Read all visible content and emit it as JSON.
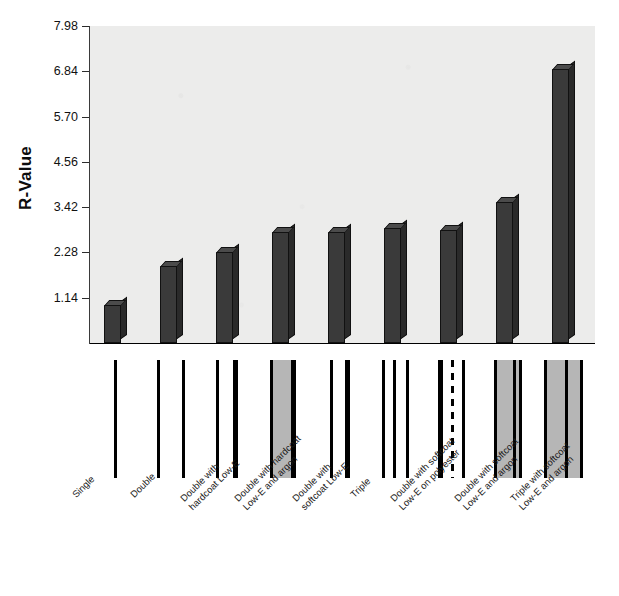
{
  "chart_data": {
    "type": "bar",
    "title": "",
    "xlabel": "",
    "ylabel": "R-Value",
    "ylim": [
      0,
      7.98
    ],
    "grid": false,
    "legend": "none",
    "ytick_labels": [
      "7.98",
      "6.84",
      "5.70",
      "4.56",
      "3.42",
      "2.28",
      "1.14"
    ],
    "ytick_values": [
      7.98,
      6.84,
      5.7,
      4.56,
      3.42,
      2.28,
      1.14
    ],
    "categories": [
      "Single",
      "Double",
      "Double with\nhardcoat Low-E",
      "Double with hardcoat\nLow-E and argon",
      "Double with\nsoftcoat Low-E",
      "Triple",
      "Double with softcoat\nLow-E on polyester",
      "Double with softcoat\nLow-E and argon",
      "Triple with softcoat\nLow-E and argon"
    ],
    "values": [
      0.95,
      1.95,
      2.3,
      2.8,
      2.8,
      2.9,
      2.85,
      3.55,
      6.9
    ],
    "bar_color": "#3a3a3a",
    "plot_background": "#ececeb",
    "page_background": "#ffffff"
  },
  "glazing_diagrams": [
    {
      "name": "single",
      "panes": 1,
      "fills": []
    },
    {
      "name": "double",
      "panes": 2,
      "fills": [
        "air"
      ]
    },
    {
      "name": "double-hardcoat-low-e",
      "panes": 2,
      "fills": [
        "air"
      ]
    },
    {
      "name": "double-hardcoat-low-e-argon",
      "panes": 2,
      "fills": [
        "argon"
      ]
    },
    {
      "name": "double-softcoat-low-e",
      "panes": 2,
      "fills": [
        "air"
      ]
    },
    {
      "name": "triple",
      "panes": 3,
      "fills": [
        "air",
        "air"
      ]
    },
    {
      "name": "double-softcoat-low-e-polyester",
      "panes": 3,
      "fills": [
        "air",
        "air"
      ]
    },
    {
      "name": "double-softcoat-low-e-argon",
      "panes": 2,
      "fills": [
        "argon"
      ]
    },
    {
      "name": "triple-softcoat-low-e-argon",
      "panes": 2,
      "fills": [
        "argon"
      ]
    }
  ]
}
